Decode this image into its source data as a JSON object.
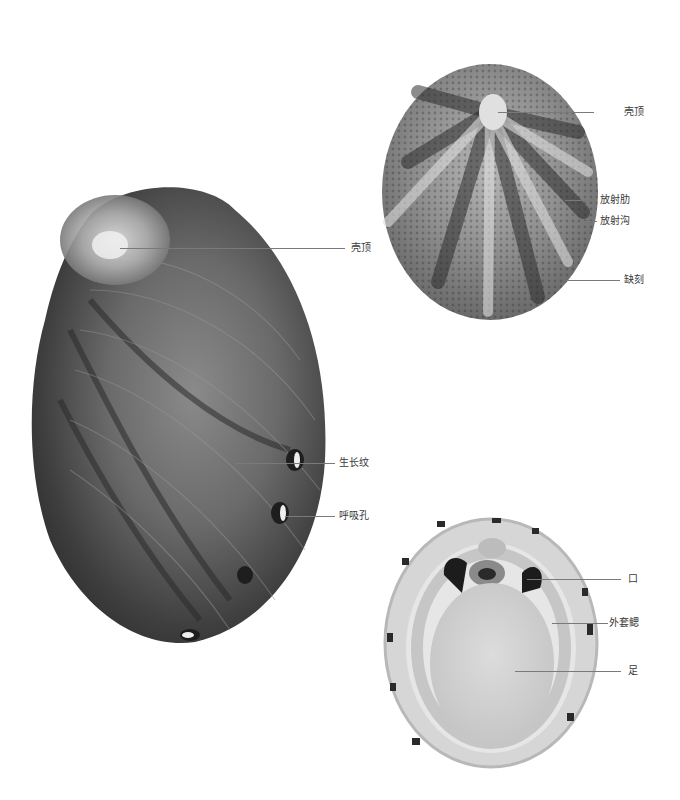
{
  "figures": {
    "abalone": {
      "description": "Abalone shell, dorsal view",
      "labels": [
        {
          "id": "apex",
          "text": "壳顶"
        },
        {
          "id": "growth_lines",
          "text": "生长纹"
        },
        {
          "id": "respiratory_pores",
          "text": "呼吸孔"
        }
      ]
    },
    "limpet_dorsal": {
      "description": "Limpet shell, dorsal view",
      "labels": [
        {
          "id": "apex",
          "text": "壳顶"
        },
        {
          "id": "radial_ribs",
          "text": "放射肋"
        },
        {
          "id": "radial_grooves",
          "text": "放射沟"
        },
        {
          "id": "notch",
          "text": "缺刻"
        }
      ]
    },
    "limpet_ventral": {
      "description": "Limpet, ventral view",
      "labels": [
        {
          "id": "mouth",
          "text": "口"
        },
        {
          "id": "pallial_gills",
          "text": "外套鳃"
        },
        {
          "id": "foot",
          "text": "足"
        }
      ]
    }
  },
  "colors": {
    "background": "#ffffff",
    "leader_line": "#7a7a7a",
    "label_text": "#3a3a3a"
  }
}
